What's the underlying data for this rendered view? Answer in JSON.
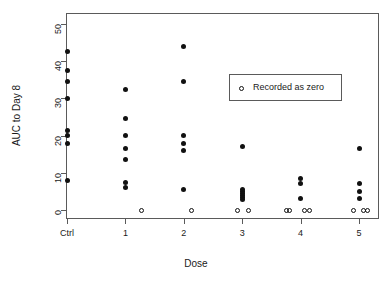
{
  "chart_data": {
    "type": "scatter",
    "title": "",
    "xlabel": "Dose",
    "ylabel": "AUC to Day 8",
    "categories": [
      "Ctrl",
      "1",
      "2",
      "3",
      "4",
      "5"
    ],
    "ytick_labels": [
      "0",
      "10",
      "20",
      "30",
      "40",
      "50"
    ],
    "ytick_values": [
      0,
      10,
      20,
      30,
      40,
      50
    ],
    "ylim": [
      -2,
      52
    ],
    "grid": false,
    "legend": {
      "position": "upper-right-inside",
      "entries": [
        {
          "label": "Recorded as zero",
          "marker": "open-circle"
        }
      ]
    },
    "series": [
      {
        "name": "Measured",
        "marker": "filled-circle",
        "points": [
          {
            "category": "Ctrl",
            "x": 0,
            "y": 42.5
          },
          {
            "category": "Ctrl",
            "x": 0,
            "y": 37.5
          },
          {
            "category": "Ctrl",
            "x": 0,
            "y": 34.5
          },
          {
            "category": "Ctrl",
            "x": 0,
            "y": 30.0
          },
          {
            "category": "Ctrl",
            "x": 0,
            "y": 21.5
          },
          {
            "category": "Ctrl",
            "x": 0,
            "y": 20.0
          },
          {
            "category": "Ctrl",
            "x": 0,
            "y": 18.0
          },
          {
            "category": "Ctrl",
            "x": 0,
            "y": 8.0
          },
          {
            "category": "1",
            "x": 1,
            "y": 32.5
          },
          {
            "category": "1",
            "x": 1,
            "y": 24.5
          },
          {
            "category": "1",
            "x": 1,
            "y": 20.0
          },
          {
            "category": "1",
            "x": 1,
            "y": 16.5
          },
          {
            "category": "1",
            "x": 1,
            "y": 13.5
          },
          {
            "category": "1",
            "x": 1,
            "y": 7.5
          },
          {
            "category": "1",
            "x": 1,
            "y": 6.0
          },
          {
            "category": "2",
            "x": 2,
            "y": 44.0
          },
          {
            "category": "2",
            "x": 2,
            "y": 34.5
          },
          {
            "category": "2",
            "x": 2,
            "y": 20.0
          },
          {
            "category": "2",
            "x": 2,
            "y": 18.0
          },
          {
            "category": "2",
            "x": 2,
            "y": 16.0
          },
          {
            "category": "2",
            "x": 2,
            "y": 5.5
          },
          {
            "category": "3",
            "x": 3,
            "y": 17.0
          },
          {
            "category": "3",
            "x": 3,
            "y": 5.5
          },
          {
            "category": "3",
            "x": 3,
            "y": 5.0
          },
          {
            "category": "3",
            "x": 3,
            "y": 4.5
          },
          {
            "category": "3",
            "x": 3,
            "y": 4.0
          },
          {
            "category": "3",
            "x": 3,
            "y": 3.4
          },
          {
            "category": "3",
            "x": 3,
            "y": 2.8
          },
          {
            "category": "4",
            "x": 4,
            "y": 8.5
          },
          {
            "category": "4",
            "x": 4,
            "y": 7.0
          },
          {
            "category": "4",
            "x": 4,
            "y": 3.0
          },
          {
            "category": "5",
            "x": 5,
            "y": 16.5
          },
          {
            "category": "5",
            "x": 5,
            "y": 7.0
          },
          {
            "category": "5",
            "x": 5,
            "y": 5.0
          },
          {
            "category": "5",
            "x": 5,
            "y": 3.0
          }
        ]
      },
      {
        "name": "Recorded as zero",
        "marker": "open-circle",
        "points": [
          {
            "category": "1",
            "x": 1.28,
            "y": 0
          },
          {
            "category": "2",
            "x": 2.13,
            "y": 0
          },
          {
            "category": "3",
            "x": 2.92,
            "y": 0
          },
          {
            "category": "3",
            "x": 3.11,
            "y": 0
          },
          {
            "category": "4",
            "x": 3.76,
            "y": 0
          },
          {
            "category": "4",
            "x": 3.81,
            "y": 0
          },
          {
            "category": "4",
            "x": 4.06,
            "y": 0
          },
          {
            "category": "4",
            "x": 4.16,
            "y": 0
          },
          {
            "category": "5",
            "x": 4.9,
            "y": 0
          },
          {
            "category": "5",
            "x": 5.08,
            "y": 0
          },
          {
            "category": "5",
            "x": 5.14,
            "y": 0
          }
        ]
      }
    ]
  }
}
